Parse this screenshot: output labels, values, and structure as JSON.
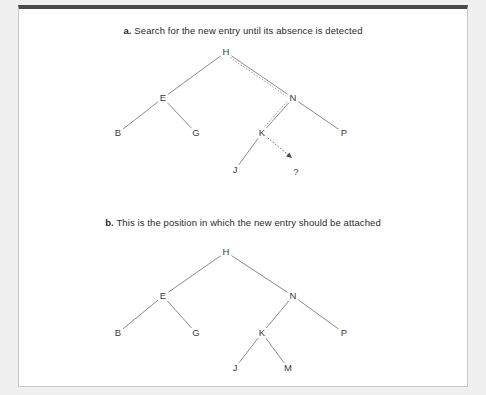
{
  "figure": {
    "background_color": "#f0f0f0",
    "panel_color": "#ffffff",
    "panel_border_color": "#c8c8c8",
    "panel_top_bar_color": "#4a4a4a",
    "edge_color": "#8a8a8a",
    "label_color": "#3a3a3a",
    "dotted_path_color": "#9a9a9a"
  },
  "parts": [
    {
      "id": "a",
      "label": "a.",
      "caption": "Search for the new entry until its absence is detected",
      "nodes": [
        {
          "name": "H",
          "x": 226,
          "y": 52
        },
        {
          "name": "E",
          "x": 163,
          "y": 98
        },
        {
          "name": "N",
          "x": 293,
          "y": 98
        },
        {
          "name": "B",
          "x": 118,
          "y": 133
        },
        {
          "name": "G",
          "x": 196,
          "y": 133
        },
        {
          "name": "K",
          "x": 262,
          "y": 133
        },
        {
          "name": "P",
          "x": 344,
          "y": 133
        },
        {
          "name": "J",
          "x": 235,
          "y": 170
        }
      ],
      "edges": [
        {
          "from": "H",
          "to": "E"
        },
        {
          "from": "H",
          "to": "N"
        },
        {
          "from": "E",
          "to": "B"
        },
        {
          "from": "E",
          "to": "G"
        },
        {
          "from": "N",
          "to": "K"
        },
        {
          "from": "N",
          "to": "P"
        },
        {
          "from": "K",
          "to": "J"
        }
      ],
      "search_path": [
        "H",
        "N",
        "K"
      ],
      "missing_marker": {
        "name": "?",
        "x": 296,
        "y": 172
      },
      "arrow_tip": {
        "x": 292,
        "y": 158
      }
    },
    {
      "id": "b",
      "label": "b.",
      "caption": "This is the position in which the new entry should be attached",
      "nodes": [
        {
          "name": "H",
          "x": 226,
          "y": 252
        },
        {
          "name": "E",
          "x": 163,
          "y": 296
        },
        {
          "name": "N",
          "x": 293,
          "y": 296
        },
        {
          "name": "B",
          "x": 118,
          "y": 333
        },
        {
          "name": "G",
          "x": 196,
          "y": 333
        },
        {
          "name": "K",
          "x": 262,
          "y": 333
        },
        {
          "name": "P",
          "x": 344,
          "y": 333
        },
        {
          "name": "J",
          "x": 235,
          "y": 368
        },
        {
          "name": "M",
          "x": 288,
          "y": 368
        }
      ],
      "edges": [
        {
          "from": "H",
          "to": "E"
        },
        {
          "from": "H",
          "to": "N"
        },
        {
          "from": "E",
          "to": "B"
        },
        {
          "from": "E",
          "to": "G"
        },
        {
          "from": "N",
          "to": "K"
        },
        {
          "from": "N",
          "to": "P"
        },
        {
          "from": "K",
          "to": "J"
        },
        {
          "from": "K",
          "to": "M"
        }
      ],
      "search_path": [],
      "missing_marker": null
    }
  ]
}
